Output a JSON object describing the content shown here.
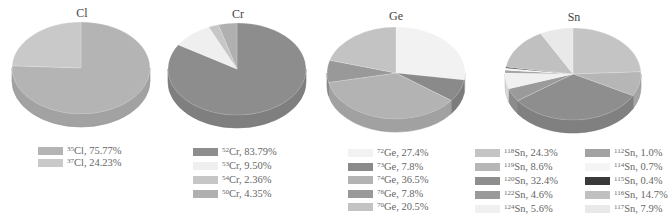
{
  "chart_data": [
    {
      "type": "pie",
      "title": "Cl",
      "slices": [
        {
          "isotope": "35",
          "element": "Cl",
          "value": 75.77,
          "label": "Cl, 75.77%",
          "color": "#b4b4b4"
        },
        {
          "isotope": "37",
          "element": "Cl",
          "value": 24.23,
          "label": "Cl, 24.23%",
          "color": "#c9c9c9"
        }
      ]
    },
    {
      "type": "pie",
      "title": "Cr",
      "slices": [
        {
          "isotope": "52",
          "element": "Cr",
          "value": 83.79,
          "label": "Cr, 83.79%",
          "color": "#8d8d8d"
        },
        {
          "isotope": "53",
          "element": "Cr",
          "value": 9.5,
          "label": "Cr, 9.50%",
          "color": "#efefef"
        },
        {
          "isotope": "54",
          "element": "Cr",
          "value": 2.36,
          "label": "Cr, 2.36%",
          "color": "#c6c6c6"
        },
        {
          "isotope": "50",
          "element": "Cr",
          "value": 4.35,
          "label": "Cr, 4.35%",
          "color": "#b0b0b0"
        }
      ]
    },
    {
      "type": "pie",
      "title": "Ge",
      "slices": [
        {
          "isotope": "72",
          "element": "Ge",
          "value": 27.4,
          "label": "Ge, 27.4%",
          "color": "#f2f2f2"
        },
        {
          "isotope": "73",
          "element": "Ge",
          "value": 7.8,
          "label": "Ge, 7.8%",
          "color": "#8a8a8a"
        },
        {
          "isotope": "74",
          "element": "Ge",
          "value": 36.5,
          "label": "Ge, 36.5%",
          "color": "#b3b3b3"
        },
        {
          "isotope": "76",
          "element": "Ge",
          "value": 7.8,
          "label": "Ge, 7.8%",
          "color": "#999999"
        },
        {
          "isotope": "70",
          "element": "Ge",
          "value": 20.5,
          "label": "Ge, 20.5%",
          "color": "#c3c3c3"
        }
      ]
    },
    {
      "type": "pie",
      "title": "Sn",
      "slices": [
        {
          "isotope": "118",
          "element": "Sn",
          "value": 24.3,
          "label": "Sn, 24.3%",
          "color": "#c4c4c4"
        },
        {
          "isotope": "119",
          "element": "Sn",
          "value": 8.6,
          "label": "Sn, 8.6%",
          "color": "#b6b6b6"
        },
        {
          "isotope": "120",
          "element": "Sn",
          "value": 32.4,
          "label": "Sn, 32.4%",
          "color": "#8e8e8e"
        },
        {
          "isotope": "122",
          "element": "Sn",
          "value": 4.6,
          "label": "Sn, 4.6%",
          "color": "#9a9a9a"
        },
        {
          "isotope": "124",
          "element": "Sn",
          "value": 5.6,
          "label": "Sn, 5.6%",
          "color": "#f0f0f0"
        },
        {
          "isotope": "112",
          "element": "Sn",
          "value": 1.0,
          "label": "Sn, 1.0%",
          "color": "#a2a2a2"
        },
        {
          "isotope": "114",
          "element": "Sn",
          "value": 0.7,
          "label": "Sn, 0.7%",
          "color": "#f5f5f5"
        },
        {
          "isotope": "115",
          "element": "Sn",
          "value": 0.4,
          "label": "Sn, 0.4%",
          "color": "#3a3a3a"
        },
        {
          "isotope": "116",
          "element": "Sn",
          "value": 14.7,
          "label": "Sn, 14.7%",
          "color": "#c0c0c0"
        },
        {
          "isotope": "117",
          "element": "Sn",
          "value": 7.9,
          "label": "Sn, 7.9%",
          "color": "#e9e9e9"
        }
      ]
    }
  ],
  "layout": {
    "pies": [
      {
        "cx": 81,
        "cy": 68,
        "rx": 69,
        "ry": 46,
        "depth": 13,
        "title_x": 52,
        "title_y": 6,
        "legend": [
          {
            "x": 38,
            "y": 145,
            "step": 12,
            "count": 2
          }
        ]
      },
      {
        "cx": 237,
        "cy": 69,
        "rx": 69,
        "ry": 46,
        "depth": 13,
        "title_x": 208,
        "title_y": 7,
        "legend": [
          {
            "x": 193,
            "y": 146,
            "step": 14,
            "count": 4
          }
        ]
      },
      {
        "cx": 396,
        "cy": 73,
        "rx": 69,
        "ry": 46,
        "depth": 13,
        "title_x": 366,
        "title_y": 9,
        "legend": [
          {
            "x": 348,
            "y": 147,
            "step": 13.5,
            "count": 5
          }
        ]
      },
      {
        "cx": 573,
        "cy": 74,
        "rx": 68,
        "ry": 46,
        "depth": 13,
        "title_x": 544,
        "title_y": 10,
        "legend": [
          {
            "x": 475,
            "y": 147,
            "step": 14,
            "count": 5
          },
          {
            "x": 585,
            "y": 147,
            "step": 14,
            "count": 5
          }
        ]
      }
    ]
  }
}
